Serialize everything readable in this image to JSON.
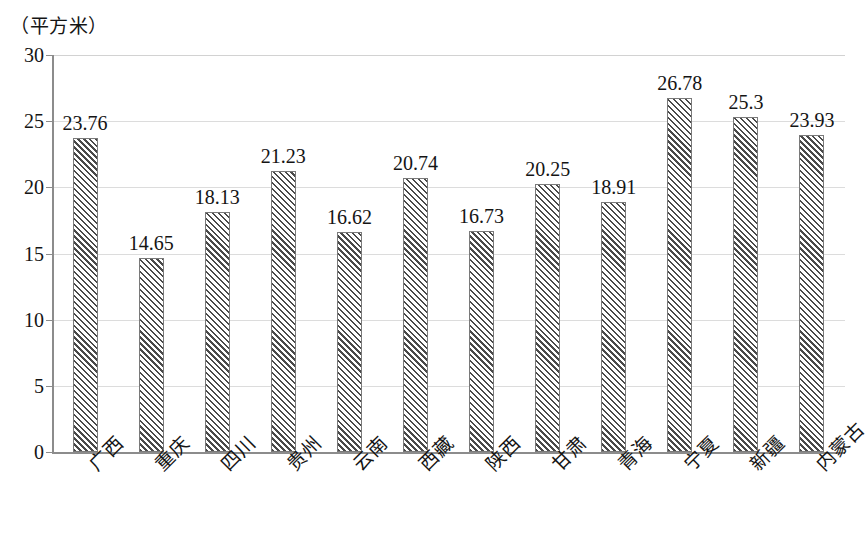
{
  "chart_data": {
    "type": "bar",
    "title": "",
    "subtitle": "",
    "unit_caption": "（平方米）",
    "xlabel": "",
    "ylabel": "（平方米）",
    "ylim": [
      0,
      30
    ],
    "y_ticks": [
      0,
      5,
      10,
      15,
      20,
      25,
      30
    ],
    "y_tick_labels": [
      "0",
      "5",
      "10",
      "15",
      "20",
      "25",
      "30"
    ],
    "grid": true,
    "legend": null,
    "legend_position": "none",
    "bar_label_format": "value-above-bar",
    "categories": [
      "广西",
      "重庆",
      "四川",
      "贵州",
      "云南",
      "西藏",
      "陕西",
      "甘肃",
      "青海",
      "宁夏",
      "新疆",
      "内蒙古"
    ],
    "values": [
      23.76,
      14.65,
      18.13,
      21.23,
      16.62,
      20.74,
      16.73,
      20.25,
      18.91,
      26.78,
      25.3,
      23.93
    ],
    "value_labels": [
      "23.76",
      "14.65",
      "18.13",
      "21.23",
      "16.62",
      "20.74",
      "16.73",
      "20.25",
      "18.91",
      "26.78",
      "25.3",
      "23.93"
    ],
    "series": [
      {
        "name": "",
        "values": [
          23.76,
          14.65,
          18.13,
          21.23,
          16.62,
          20.74,
          16.73,
          20.25,
          18.91,
          26.78,
          25.3,
          23.93
        ],
        "fill": "diagonal-hatch",
        "fill_color": "#4a4a4a",
        "background_color": "#ffffff",
        "border_color": "#7a7a7a"
      }
    ],
    "colors": {
      "hatch": "#4a4a4a",
      "bar_background": "#ffffff",
      "bar_border": "#7a7a7a",
      "gridline": "#dcdcdc",
      "axis": "#8c8c8c",
      "text": "#141414",
      "plot_background": "#ffffff"
    }
  }
}
